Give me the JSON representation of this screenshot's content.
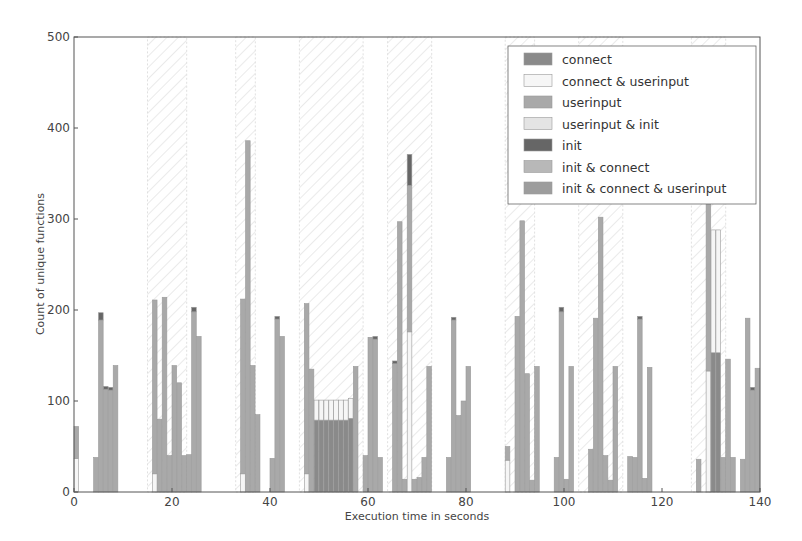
{
  "chart_data": {
    "type": "bar",
    "stacked": true,
    "title": "",
    "xlabel": "Execution time in seconds",
    "ylabel": "Count of unique functions",
    "xlim": [
      0,
      140
    ],
    "ylim": [
      0,
      500
    ],
    "xticks": [
      "0",
      "20",
      "40",
      "60",
      "80",
      "100",
      "120",
      "140"
    ],
    "yticks": [
      "0",
      "100",
      "200",
      "300",
      "400",
      "500"
    ],
    "grid": false,
    "legend_position": "upper right",
    "legend": [
      {
        "name": "connect",
        "color": "#8a8a8a"
      },
      {
        "name": "connect & userinput",
        "color": "#f6f6f6"
      },
      {
        "name": "userinput",
        "color": "#a9a9a9"
      },
      {
        "name": "userinput & init",
        "color": "#e4e4e4"
      },
      {
        "name": "init",
        "color": "#666666"
      },
      {
        "name": "init & connect",
        "color": "#b8b8b8"
      },
      {
        "name": "init & connect & userinput",
        "color": "#9d9d9d"
      }
    ],
    "shaded_regions": [
      [
        15,
        23
      ],
      [
        33,
        37
      ],
      [
        46,
        59
      ],
      [
        64,
        73
      ],
      [
        88,
        94
      ],
      [
        103,
        112
      ],
      [
        126,
        133
      ]
    ],
    "bars": [
      {
        "x": 0,
        "segments": {
          "connect & userinput": 37,
          "userinput": 35
        }
      },
      {
        "x": 4,
        "segments": {
          "userinput": 38
        }
      },
      {
        "x": 5,
        "segments": {
          "init": 8,
          "userinput": 189
        }
      },
      {
        "x": 6,
        "segments": {
          "init": 3,
          "userinput": 113
        }
      },
      {
        "x": 7,
        "segments": {
          "init": 3,
          "userinput": 112
        }
      },
      {
        "x": 8,
        "segments": {
          "userinput": 139
        }
      },
      {
        "x": 16,
        "segments": {
          "connect & userinput": 20,
          "userinput": 191
        }
      },
      {
        "x": 17,
        "segments": {
          "userinput": 80
        }
      },
      {
        "x": 18,
        "segments": {
          "userinput": 214
        }
      },
      {
        "x": 19,
        "segments": {
          "userinput": 40
        }
      },
      {
        "x": 20,
        "segments": {
          "userinput": 139
        }
      },
      {
        "x": 21,
        "segments": {
          "userinput": 120
        }
      },
      {
        "x": 22,
        "segments": {
          "userinput": 40
        }
      },
      {
        "x": 23,
        "segments": {
          "userinput": 41
        }
      },
      {
        "x": 24,
        "segments": {
          "init": 5,
          "userinput": 198
        }
      },
      {
        "x": 25,
        "segments": {
          "userinput": 171
        }
      },
      {
        "x": 34,
        "segments": {
          "connect & userinput": 20,
          "userinput": 192
        }
      },
      {
        "x": 35,
        "segments": {
          "userinput": 386
        }
      },
      {
        "x": 36,
        "segments": {
          "userinput": 139
        }
      },
      {
        "x": 37,
        "segments": {
          "userinput": 85
        }
      },
      {
        "x": 40,
        "segments": {
          "userinput": 37
        }
      },
      {
        "x": 41,
        "segments": {
          "init": 3,
          "userinput": 190
        }
      },
      {
        "x": 42,
        "segments": {
          "userinput": 171
        }
      },
      {
        "x": 47,
        "segments": {
          "connect & userinput": 20,
          "userinput": 187
        }
      },
      {
        "x": 48,
        "segments": {
          "userinput": 135
        }
      },
      {
        "x": 49,
        "segments": {
          "connect & userinput": 22,
          "connect": 79
        }
      },
      {
        "x": 50,
        "segments": {
          "connect & userinput": 22,
          "connect": 79
        }
      },
      {
        "x": 51,
        "segments": {
          "connect & userinput": 22,
          "connect": 79
        }
      },
      {
        "x": 52,
        "segments": {
          "connect & userinput": 22,
          "connect": 79
        }
      },
      {
        "x": 53,
        "segments": {
          "connect & userinput": 22,
          "connect": 79
        }
      },
      {
        "x": 54,
        "segments": {
          "connect & userinput": 22,
          "connect": 79
        }
      },
      {
        "x": 55,
        "segments": {
          "connect & userinput": 22,
          "connect": 79
        }
      },
      {
        "x": 56,
        "segments": {
          "connect & userinput": 22,
          "connect": 81
        }
      },
      {
        "x": 57,
        "segments": {
          "userinput": 138
        }
      },
      {
        "x": 59,
        "segments": {
          "userinput": 40
        }
      },
      {
        "x": 60,
        "segments": {
          "userinput": 170
        }
      },
      {
        "x": 61,
        "segments": {
          "init": 3,
          "userinput": 168
        }
      },
      {
        "x": 62,
        "segments": {
          "userinput": 38
        }
      },
      {
        "x": 65,
        "segments": {
          "init": 3,
          "userinput": 141
        }
      },
      {
        "x": 66,
        "segments": {
          "userinput": 297
        }
      },
      {
        "x": 67,
        "segments": {
          "userinput": 14
        }
      },
      {
        "x": 68,
        "segments": {
          "init": 34,
          "connect & userinput": 176,
          "userinput": 161
        }
      },
      {
        "x": 69,
        "segments": {
          "userinput": 14
        }
      },
      {
        "x": 70,
        "segments": {
          "userinput": 16
        }
      },
      {
        "x": 71,
        "segments": {
          "userinput": 38
        }
      },
      {
        "x": 72,
        "segments": {
          "userinput": 138
        }
      },
      {
        "x": 76,
        "segments": {
          "userinput": 38
        }
      },
      {
        "x": 77,
        "segments": {
          "init": 3,
          "userinput": 189
        }
      },
      {
        "x": 78,
        "segments": {
          "userinput": 84
        }
      },
      {
        "x": 79,
        "segments": {
          "userinput": 100
        }
      },
      {
        "x": 80,
        "segments": {
          "userinput": 138
        }
      },
      {
        "x": 88,
        "segments": {
          "connect & userinput": 35,
          "userinput": 15
        }
      },
      {
        "x": 90,
        "segments": {
          "userinput": 193
        }
      },
      {
        "x": 91,
        "segments": {
          "userinput": 298
        }
      },
      {
        "x": 92,
        "segments": {
          "userinput": 130
        }
      },
      {
        "x": 93,
        "segments": {
          "userinput": 13
        }
      },
      {
        "x": 94,
        "segments": {
          "userinput": 138
        }
      },
      {
        "x": 98,
        "segments": {
          "userinput": 38
        }
      },
      {
        "x": 99,
        "segments": {
          "init": 5,
          "userinput": 198
        }
      },
      {
        "x": 100,
        "segments": {
          "userinput": 14
        }
      },
      {
        "x": 101,
        "segments": {
          "userinput": 138
        }
      },
      {
        "x": 105,
        "segments": {
          "userinput": 47
        }
      },
      {
        "x": 106,
        "segments": {
          "userinput": 191
        }
      },
      {
        "x": 107,
        "segments": {
          "userinput": 302
        }
      },
      {
        "x": 108,
        "segments": {
          "userinput": 40
        }
      },
      {
        "x": 109,
        "segments": {
          "userinput": 13
        }
      },
      {
        "x": 110,
        "segments": {
          "userinput": 138
        }
      },
      {
        "x": 113,
        "segments": {
          "userinput": 39
        }
      },
      {
        "x": 114,
        "segments": {
          "userinput": 38
        }
      },
      {
        "x": 115,
        "segments": {
          "init": 3,
          "userinput": 190
        }
      },
      {
        "x": 116,
        "segments": {
          "userinput": 15
        }
      },
      {
        "x": 117,
        "segments": {
          "userinput": 137
        }
      },
      {
        "x": 127,
        "segments": {
          "userinput": 36
        }
      },
      {
        "x": 129,
        "segments": {
          "connect & userinput": 133,
          "userinput": 187
        }
      },
      {
        "x": 130,
        "segments": {
          "connect & userinput": 135,
          "connect": 153
        }
      },
      {
        "x": 131,
        "segments": {
          "connect & userinput": 135,
          "connect": 153
        }
      },
      {
        "x": 132,
        "segments": {
          "userinput": 38
        }
      },
      {
        "x": 133,
        "segments": {
          "userinput": 146
        }
      },
      {
        "x": 134,
        "segments": {
          "userinput": 38
        }
      },
      {
        "x": 136,
        "segments": {
          "userinput": 36
        }
      },
      {
        "x": 137,
        "segments": {
          "userinput": 191
        }
      },
      {
        "x": 138,
        "segments": {
          "init": 3,
          "userinput": 112
        }
      },
      {
        "x": 139,
        "segments": {
          "userinput": 136
        }
      }
    ]
  }
}
